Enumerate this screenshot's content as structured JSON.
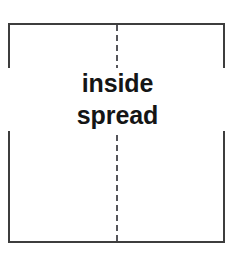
{
  "diagram": {
    "type": "page-spread-schematic",
    "background_color": "#ffffff",
    "outline": {
      "label": "spread-outline",
      "stroke_color": "#3d3d3d",
      "stroke_width_px": 2,
      "fill_color": "#ffffff",
      "x": 8,
      "y": 23,
      "width": 217,
      "height": 220
    },
    "gutter": {
      "label": "center-fold-line",
      "style": "dashed",
      "stroke_color": "#55555a",
      "stroke_width_px": 2,
      "dash_px": 6,
      "gap_px": 4,
      "orientation": "vertical",
      "position": "center"
    },
    "caption": {
      "line1": "inside",
      "line2": "spread",
      "text_color": "#151515",
      "font_size_px": 25,
      "font_weight": "bold",
      "align": "center"
    }
  }
}
